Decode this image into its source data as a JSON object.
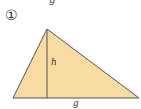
{
  "figure": {
    "number_label": "①",
    "top_clipped_text": "g",
    "triangle": {
      "apex": [
        47,
        29
      ],
      "bottom_left": [
        13,
        98
      ],
      "bottom_right": [
        139,
        98
      ],
      "altitude_foot": [
        47,
        98
      ],
      "fill_color": "#f8dba3",
      "stroke_color": "#555555"
    },
    "labels": {
      "height": "h",
      "base": "g"
    }
  }
}
